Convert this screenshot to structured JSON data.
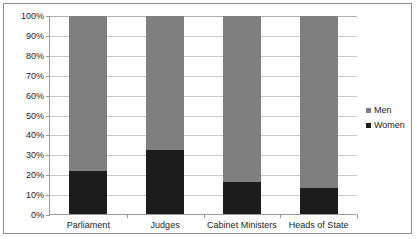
{
  "chart_data": {
    "type": "bar",
    "subtype": "stacked-100-percent",
    "title": "",
    "subtitle": "",
    "xlabel": "",
    "ylabel": "",
    "categories": [
      "Parliament",
      "Judges",
      "Cabinet Ministers",
      "Heads of State"
    ],
    "series": [
      {
        "name": "Men",
        "color": "#7f7f7f",
        "values": [
          78.5,
          67.5,
          84.0,
          87.0
        ]
      },
      {
        "name": "Women",
        "color": "#1c1c1c",
        "values": [
          21.5,
          32.5,
          16.0,
          13.0
        ]
      }
    ],
    "ylim": [
      0,
      100
    ],
    "ytick_values": [
      0,
      10,
      20,
      30,
      40,
      50,
      60,
      70,
      80,
      90,
      100
    ],
    "ytick_labels": [
      "0%",
      "10%",
      "20%",
      "30%",
      "40%",
      "50%",
      "60%",
      "70%",
      "80%",
      "90%",
      "100%"
    ],
    "grid": true,
    "grid_axis": "y",
    "legend": {
      "position": "right",
      "entries": [
        {
          "label": "Men",
          "color": "#7f7f7f"
        },
        {
          "label": "Women",
          "color": "#1c1c1c"
        }
      ]
    },
    "annotations": [],
    "colors": {
      "plot_background": "#ffffff",
      "gridline": "#c9c9c9",
      "axis_line": "#9a9a9a",
      "frame_border": "#8f8f8f",
      "text": "#1d1d1d"
    }
  }
}
